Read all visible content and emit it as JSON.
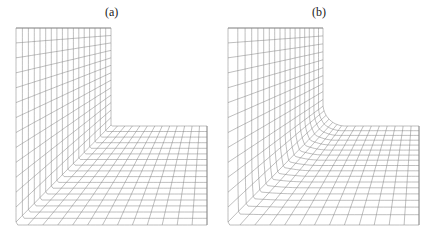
{
  "panels": [
    {
      "label": "(a)",
      "description": "Structured curvilinear mesh on L-shaped domain with sharp re-entrant corner"
    },
    {
      "label": "(b)",
      "description": "Structured curvilinear mesh on L-shaped domain with rounded (fillet) re-entrant corner"
    }
  ],
  "colors": {
    "grid": "#8a8a8a",
    "background": "#ffffff"
  }
}
